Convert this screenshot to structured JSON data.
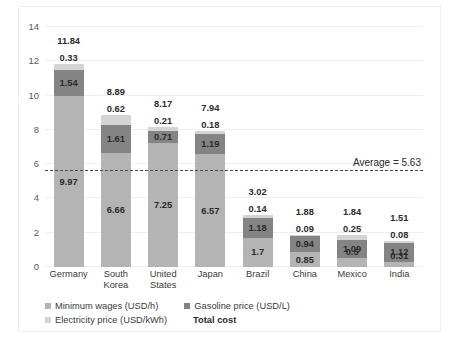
{
  "chart_data": {
    "type": "bar",
    "subtype": "stacked-bar",
    "title": "",
    "xlabel": "",
    "ylabel": "",
    "ylim": [
      0,
      14
    ],
    "ytick_step": 2,
    "yticks": [
      "14",
      "12",
      "10",
      "8",
      "6",
      "4",
      "2",
      "0"
    ],
    "grid": true,
    "legend_position": "bottom",
    "categories": [
      "Germany",
      "South Korea",
      "United States",
      "Japan",
      "Brazil",
      "China",
      "Mexico",
      "India"
    ],
    "series": [
      {
        "name": "Minimum wages (USD/h)",
        "color": "#b4b4b4",
        "values": [
          9.97,
          6.66,
          7.25,
          6.57,
          1.7,
          0.85,
          0.5,
          0.31
        ],
        "labels": [
          "9.97",
          "6.66",
          "7.25",
          "6.57",
          "1.7",
          "0.85",
          "0.5",
          "0.31"
        ]
      },
      {
        "name": "Gasoline price (USD/L)",
        "color": "#848484",
        "values": [
          1.54,
          1.61,
          0.71,
          1.19,
          1.18,
          0.94,
          1.09,
          1.12
        ],
        "labels": [
          "1.54",
          "1.61",
          "0.71",
          "1.19",
          "1.18",
          "0.94",
          "1.09",
          "1.12"
        ]
      },
      {
        "name": "Electricity price (USD/kWh)",
        "color": "#d4d4d4",
        "values": [
          0.33,
          0.62,
          0.21,
          0.18,
          0.14,
          0.09,
          0.25,
          0.08
        ],
        "labels": [
          "0.33",
          "0.62",
          "0.21",
          "0.18",
          "0.14",
          "0.09",
          "0.25",
          "0.08"
        ]
      }
    ],
    "totals": [
      11.84,
      8.89,
      8.17,
      7.94,
      3.02,
      1.88,
      1.84,
      1.51
    ],
    "total_labels": [
      "11.84",
      "8.89",
      "8.17",
      "7.94",
      "3.02",
      "1.88",
      "1.84",
      "1.51"
    ],
    "total_series_name": "Total cost",
    "average_line": {
      "value": 5.63,
      "label": "Average = 5.63",
      "style": "dashed",
      "color": "#4a4a4a"
    }
  },
  "legend": {
    "items": [
      {
        "label": "Minimum wages (USD/h)",
        "color": "#b4b4b4",
        "bold": false
      },
      {
        "label": "Gasoline price (USD/L)",
        "color": "#848484",
        "bold": false
      },
      {
        "label": "Electricity price (USD/kWh)",
        "color": "#d4d4d4",
        "bold": false
      },
      {
        "label": "Total cost",
        "color": "",
        "bold": true
      }
    ]
  }
}
